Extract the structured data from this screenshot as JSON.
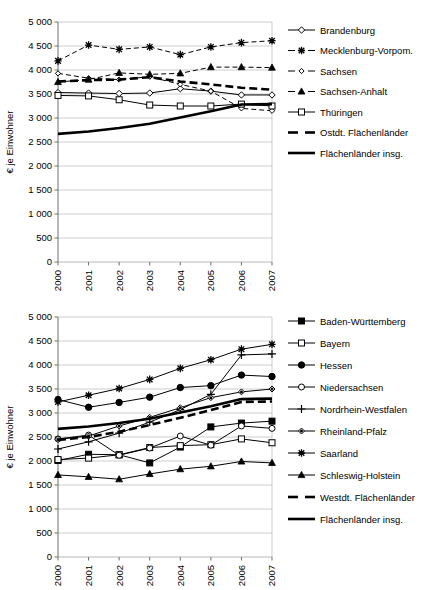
{
  "axis": {
    "ylabel": "€ je Einwohner",
    "yticks": [
      "0",
      "500",
      "1 000",
      "1 500",
      "2 000",
      "2 500",
      "3 000",
      "3 500",
      "4 000",
      "4 500",
      "5 000"
    ],
    "xticks": [
      "2000",
      "2001",
      "2002",
      "2003",
      "2004",
      "2005",
      "2006",
      "2007"
    ]
  },
  "chart_data": [
    {
      "id": "ostdeutsche-flaechenlaender",
      "type": "line",
      "title": "",
      "xlabel": "",
      "ylabel": "€ je Einwohner",
      "x": [
        2000,
        2001,
        2002,
        2003,
        2004,
        2005,
        2006,
        2007
      ],
      "ylim": [
        0,
        5000
      ],
      "ytick_step": 500,
      "grid": true,
      "legend_position": "right",
      "series": [
        {
          "name": "Brandenburg",
          "marker": "diamond-open",
          "line": "solid",
          "values": [
            3530,
            3520,
            3510,
            3520,
            3610,
            3560,
            3480,
            3480
          ]
        },
        {
          "name": "Mecklenburg-Vorpom.",
          "marker": "star",
          "line": "dashed",
          "values": [
            4190,
            4520,
            4430,
            4480,
            4320,
            4480,
            4570,
            4610
          ]
        },
        {
          "name": "Sachsen",
          "marker": "diamond-small-open",
          "line": "dashed",
          "values": [
            3930,
            3830,
            3800,
            3860,
            3700,
            3560,
            3200,
            3150
          ]
        },
        {
          "name": "Sachsen-Anhalt",
          "marker": "triangle-filled",
          "line": "dashed",
          "values": [
            3750,
            3800,
            3940,
            3910,
            3930,
            4060,
            4060,
            4050
          ]
        },
        {
          "name": "Thüringen",
          "marker": "square-open",
          "line": "solid",
          "values": [
            3470,
            3460,
            3380,
            3270,
            3250,
            3250,
            3290,
            3250
          ]
        },
        {
          "name": "Ostdt. Flächenländer",
          "marker": "none",
          "line": "thick-dashed",
          "values": [
            3760,
            3790,
            3800,
            3850,
            3760,
            3700,
            3630,
            3590
          ]
        },
        {
          "name": "Flächenländer insg.",
          "marker": "none",
          "line": "thick-solid",
          "values": [
            2670,
            2720,
            2790,
            2880,
            3010,
            3140,
            3280,
            3290
          ]
        }
      ]
    },
    {
      "id": "westdeutsche-flaechenlaender",
      "type": "line",
      "title": "",
      "xlabel": "",
      "ylabel": "€ je Einwohner",
      "x": [
        2000,
        2001,
        2002,
        2003,
        2004,
        2005,
        2006,
        2007
      ],
      "ylim": [
        0,
        5000
      ],
      "ytick_step": 500,
      "grid": true,
      "legend_position": "right",
      "series": [
        {
          "name": "Baden-Württemberg",
          "marker": "square-filled",
          "line": "solid",
          "values": [
            2010,
            2140,
            2130,
            1960,
            2290,
            2710,
            2790,
            2830
          ]
        },
        {
          "name": "Bayern",
          "marker": "square-open",
          "line": "solid",
          "values": [
            2030,
            2060,
            2130,
            2280,
            2320,
            2340,
            2460,
            2380
          ]
        },
        {
          "name": "Hessen",
          "marker": "circle-filled",
          "line": "solid",
          "values": [
            3280,
            3120,
            3220,
            3330,
            3530,
            3570,
            3790,
            3760
          ]
        },
        {
          "name": "Niedersachsen",
          "marker": "circle-open",
          "line": "solid",
          "values": [
            2460,
            2540,
            2120,
            2270,
            2520,
            2330,
            2730,
            2680
          ]
        },
        {
          "name": "Nordrhein-Westfalen",
          "marker": "plus",
          "line": "solid",
          "values": [
            2250,
            2400,
            2580,
            2810,
            3070,
            3390,
            4210,
            4230
          ]
        },
        {
          "name": "Rheinland-Pfalz",
          "marker": "diamond-small-filled",
          "line": "solid",
          "values": [
            2450,
            2520,
            2730,
            2910,
            3110,
            3320,
            3440,
            3500
          ]
        },
        {
          "name": "Saarland",
          "marker": "star",
          "line": "solid",
          "values": [
            3230,
            3370,
            3510,
            3700,
            3930,
            4110,
            4330,
            4430
          ]
        },
        {
          "name": "Schleswig-Holstein",
          "marker": "triangle-filled",
          "line": "solid",
          "values": [
            1710,
            1670,
            1620,
            1730,
            1830,
            1890,
            1990,
            1960
          ]
        },
        {
          "name": "Westdt. Flächenländer",
          "marker": "none",
          "line": "thick-dashed",
          "values": [
            2440,
            2500,
            2610,
            2750,
            2900,
            3060,
            3230,
            3240
          ]
        },
        {
          "name": "Flächenländer insg.",
          "marker": "none",
          "line": "thick-solid",
          "values": [
            2670,
            2720,
            2790,
            2880,
            3010,
            3140,
            3290,
            3300
          ]
        }
      ]
    }
  ]
}
